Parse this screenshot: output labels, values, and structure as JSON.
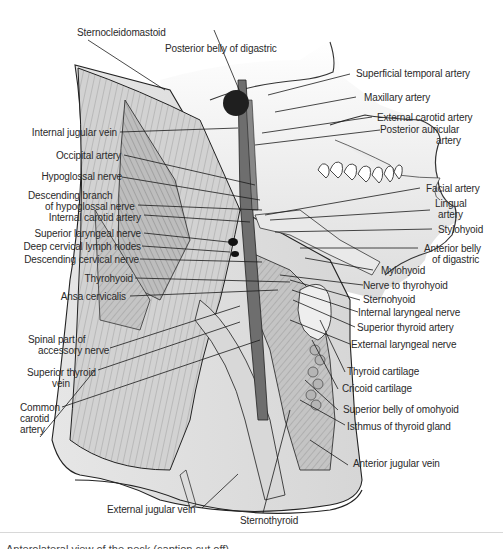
{
  "figure": {
    "type": "anatomical-illustration",
    "colors": {
      "background": "#ffffff",
      "skin": "#e4e4e4",
      "muscle": "#c9c9c9",
      "muscle_dark": "#9a9a9a",
      "vessel": "#6e6e6e",
      "outline": "#1e1e1e",
      "label_text": "#2a2a2a"
    }
  },
  "labels": {
    "top": [
      {
        "id": "sternocleidomastoid",
        "text": "Sternocleidomastoid"
      },
      {
        "id": "posterior-belly-digastric",
        "text": "Posterior belly of digastric"
      }
    ],
    "left": [
      {
        "id": "internal-jugular-vein",
        "text": "Internal jugular vein"
      },
      {
        "id": "occipital-artery",
        "text": "Occipital artery"
      },
      {
        "id": "hypoglossal-nerve",
        "text": "Hypoglossal nerve"
      },
      {
        "id": "descending-branch-hypoglossal",
        "text": "Descending branch",
        "text2": "of  hypoglossal nerve"
      },
      {
        "id": "internal-carotid-artery",
        "text": "Internal carotid artery"
      },
      {
        "id": "superior-laryngeal-nerve",
        "text": "Superior laryngeal nerve"
      },
      {
        "id": "deep-cervical-lymph-nodes",
        "text": "Deep cervical lymph nodes"
      },
      {
        "id": "descending-cervical-nerve",
        "text": "Descending cervical nerve"
      },
      {
        "id": "thyrohyoid",
        "text": "Thyrohyoid"
      },
      {
        "id": "ansa-cervicalis",
        "text": "Ansa cervicalis"
      },
      {
        "id": "spinal-accessory-nerve",
        "text": "Spinal part of",
        "text2": "accessory nerve"
      },
      {
        "id": "superior-thyroid-vein",
        "text": "Superior thyroid",
        "text2": "vein"
      },
      {
        "id": "common-carotid-artery",
        "text": "Common",
        "text2": "carotid",
        "text3": "artery"
      }
    ],
    "right": [
      {
        "id": "superficial-temporal-artery",
        "text": "Superficial temporal artery"
      },
      {
        "id": "maxillary-artery",
        "text": "Maxillary artery"
      },
      {
        "id": "external-carotid-artery",
        "text": "External carotid artery"
      },
      {
        "id": "posterior-auricular-artery",
        "text": "Posterior auricular",
        "text2": "artery"
      },
      {
        "id": "facial-artery",
        "text": "Facial artery"
      },
      {
        "id": "lingual-artery",
        "text": "Lingual",
        "text2": "artery"
      },
      {
        "id": "stylohyoid",
        "text": "Stylohyoid"
      },
      {
        "id": "anterior-belly-digastric",
        "text": "Anterior belly",
        "text2": "of digastric"
      },
      {
        "id": "mylohyoid",
        "text": "Mylohyoid"
      },
      {
        "id": "nerve-to-thyrohyoid",
        "text": "Nerve to thyrohyoid"
      },
      {
        "id": "sternohyoid",
        "text": "Sternohyoid"
      },
      {
        "id": "internal-laryngeal-nerve",
        "text": "Internal laryngeal nerve"
      },
      {
        "id": "superior-thyroid-artery",
        "text": "Superior thyroid artery"
      },
      {
        "id": "external-laryngeal-nerve",
        "text": "External laryngeal nerve"
      },
      {
        "id": "thyroid-cartilage",
        "text": "Thyroid cartilage"
      },
      {
        "id": "cricoid-cartilage",
        "text": "Cricoid cartilage"
      },
      {
        "id": "superior-belly-omohyoid",
        "text": "Superior belly of omohyoid"
      },
      {
        "id": "isthmus-thyroid-gland",
        "text": "Isthmus of thyroid gland"
      },
      {
        "id": "anterior-jugular-vein",
        "text": "Anterior jugular vein"
      }
    ],
    "bottom": [
      {
        "id": "external-jugular-vein",
        "text": "External jugular vein"
      },
      {
        "id": "sternothyroid",
        "text": "Sternothyroid"
      }
    ]
  },
  "caption": {
    "text": "Anterolateral view of the neck (caption cut off)"
  }
}
